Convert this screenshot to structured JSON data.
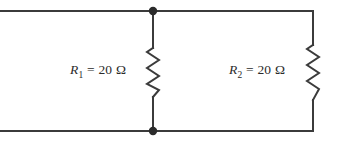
{
  "figure": {
    "background_color": "#ffffff",
    "stroke_color": "#3b3b3b",
    "text_color": "#2b2b2b"
  },
  "components": {
    "resistor_1": {
      "symbol": "R",
      "subscript": "1",
      "equals": "=",
      "value": "20",
      "unit": "Ω",
      "full_label": "R1 = 20 Ω"
    },
    "resistor_2": {
      "symbol": "R",
      "subscript": "2",
      "equals": "=",
      "value": "20",
      "unit": "Ω",
      "full_label": "R2 = 20 Ω"
    }
  },
  "nodes": {
    "top_junction": "node-top",
    "bottom_junction": "node-bottom"
  }
}
